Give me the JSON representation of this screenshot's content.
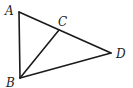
{
  "figure": {
    "type": "triangle-geometry",
    "points": {
      "A": {
        "label": "A",
        "x": 19,
        "y": 12,
        "label_x": 5,
        "label_y": 15
      },
      "B": {
        "label": "B",
        "x": 20,
        "y": 78,
        "label_x": 6,
        "label_y": 87
      },
      "C": {
        "label": "C",
        "x": 59,
        "y": 30,
        "label_x": 58,
        "label_y": 26
      },
      "D": {
        "label": "D",
        "x": 111,
        "y": 53,
        "label_x": 116,
        "label_y": 58
      }
    },
    "segments": [
      {
        "from": "A",
        "to": "B"
      },
      {
        "from": "A",
        "to": "D"
      },
      {
        "from": "B",
        "to": "D"
      },
      {
        "from": "B",
        "to": "C"
      }
    ],
    "colors": {
      "stroke": "#1a1a1a",
      "background": "#ffffff"
    }
  }
}
